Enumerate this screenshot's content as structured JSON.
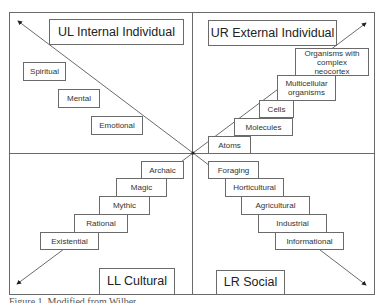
{
  "diagram": {
    "quadrants": {
      "ul": {
        "title": "UL Internal Individual",
        "levels": [
          "Spiritual",
          "Mental",
          "Emotional"
        ]
      },
      "ur": {
        "title": "UR External Individual",
        "levels": [
          "Organisms with complex neocortex",
          "Multicellular organisms",
          "Cells",
          "Molecules",
          "Atoms"
        ]
      },
      "ll": {
        "title": "LL Cultural",
        "levels": [
          "Archaic",
          "Magic",
          "Mythic",
          "Rational",
          "Existential"
        ]
      },
      "lr": {
        "title": "LR Social",
        "levels": [
          "Foraging",
          "Horticultural",
          "Agricultural",
          "Industrial",
          "Informational"
        ]
      }
    },
    "caption": "Figure 1. Modified from Wilber"
  }
}
